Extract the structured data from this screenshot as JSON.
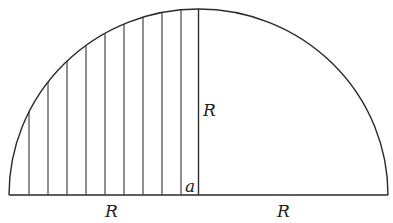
{
  "diagram": {
    "type": "semicircle-with-strips",
    "colors": {
      "line": "#2a2a2a",
      "background": "#ffffff",
      "text": "#222222"
    },
    "geometry": {
      "center_x": 198.5,
      "baseline_y": 195,
      "radius_x": 189.5,
      "radius_y": 186,
      "strip_count": 10,
      "strip_x": [
        29,
        48,
        67,
        86,
        105,
        124,
        143,
        162,
        181
      ]
    },
    "labels": {
      "left_base": "R",
      "vertical_radius": "R",
      "right_base": "R",
      "strip_width": "a"
    }
  }
}
